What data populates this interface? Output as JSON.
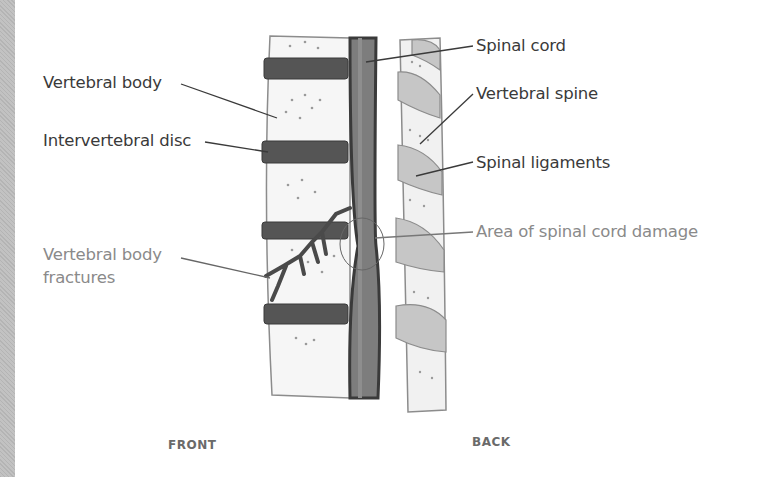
{
  "diagram": {
    "labels_left": [
      {
        "id": "vertebral-body",
        "text": "Vertebral body",
        "highlight": false
      },
      {
        "id": "intervertebral-disc",
        "text": "Intervertebral disc",
        "highlight": false
      },
      {
        "id": "vertebral-body-fractures",
        "line1": "Vertebral body",
        "line2": "fractures",
        "highlight": true
      }
    ],
    "labels_right": [
      {
        "id": "spinal-cord",
        "text": "Spinal cord",
        "highlight": false
      },
      {
        "id": "vertebral-spine",
        "text": "Vertebral spine",
        "highlight": false
      },
      {
        "id": "spinal-ligaments",
        "text": "Spinal ligaments",
        "highlight": false
      },
      {
        "id": "spinal-cord-damage",
        "text": "Area of spinal cord damage",
        "highlight": true
      }
    ],
    "orientation": {
      "front": "FRONT",
      "back": "BACK"
    },
    "colors": {
      "text": "#3a3a3a",
      "highlight_text": "#8a8a8a",
      "disc": "#4e4e4e",
      "cord": "#7a7a7a",
      "ligament": "#bdbdbd",
      "bone": "#f4f4f4"
    }
  }
}
